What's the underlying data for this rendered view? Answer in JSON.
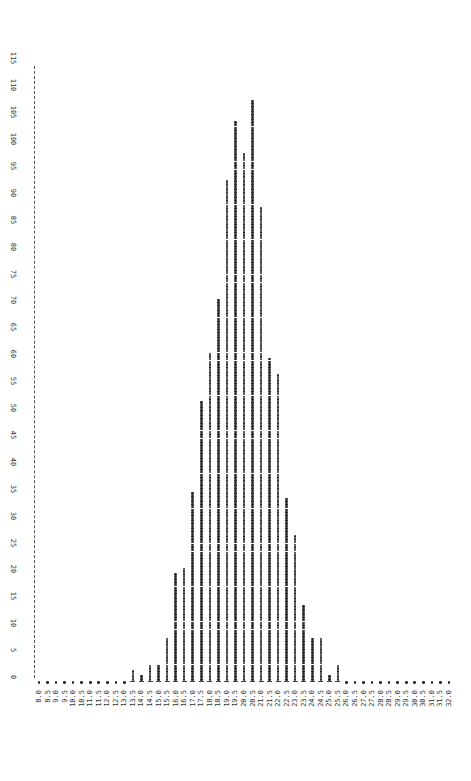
{
  "chart_data": {
    "type": "bar",
    "style": "printer dot histogram, rotated (value axis vertical on left, category labels rotated at bottom)",
    "title": "",
    "xlabel": "",
    "ylabel": "",
    "categories": [
      "8.0",
      "8.5",
      "9.0",
      "9.5",
      "10.0",
      "10.5",
      "11.0",
      "11.5",
      "12.0",
      "12.5",
      "13.0",
      "13.5",
      "14.0",
      "14.5",
      "15.0",
      "15.5",
      "16.0",
      "16.5",
      "17.0",
      "17.5",
      "18.0",
      "18.5",
      "19.0",
      "19.5",
      "20.0",
      "20.5",
      "21.0",
      "21.5",
      "22.0",
      "22.5",
      "23.0",
      "23.5",
      "24.0",
      "24.5",
      "25.0",
      "25.5",
      "26.0",
      "26.5",
      "27.0",
      "27.5",
      "28.0",
      "28.5",
      "29.0",
      "29.5",
      "30.0",
      "30.5",
      "31.0",
      "31.5",
      "32.0"
    ],
    "values": [
      0,
      0,
      0,
      0,
      0,
      0,
      0,
      0,
      0,
      0,
      0,
      2,
      1,
      3,
      3,
      8,
      20,
      21,
      35,
      52,
      61,
      71,
      93,
      104,
      98,
      108,
      88,
      60,
      57,
      34,
      27,
      14,
      8,
      8,
      1,
      3,
      0,
      0,
      0,
      0,
      0,
      0,
      0,
      0,
      0,
      0,
      0,
      0,
      0
    ],
    "yticks": [
      0,
      5,
      10,
      15,
      20,
      25,
      30,
      35,
      40,
      45,
      50,
      55,
      60,
      65,
      70,
      75,
      80,
      85,
      90,
      95,
      100,
      105,
      110,
      115
    ],
    "ytick_labels": [
      "0",
      "5",
      "10",
      "15",
      "20",
      "25",
      "30",
      "35",
      "40",
      "45",
      "50",
      "55",
      "60",
      "65",
      "70",
      "75",
      "80",
      "85",
      "90",
      "95",
      "100",
      "105",
      "110",
      "115"
    ],
    "ylim": [
      0,
      115
    ],
    "grid": false,
    "legend": null
  }
}
